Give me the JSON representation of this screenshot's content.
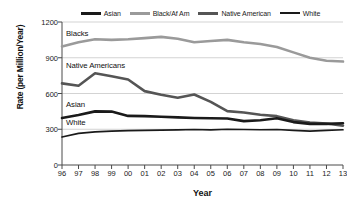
{
  "chart_data": {
    "type": "line",
    "title": "",
    "xlabel": "Year",
    "ylabel": "Rate (per Million/Year)",
    "x": [
      "96",
      "97",
      "98",
      "99",
      "00",
      "01",
      "02",
      "03",
      "04",
      "05",
      "06",
      "07",
      "08",
      "09",
      "10",
      "11",
      "12",
      "13"
    ],
    "xlim": [
      0,
      17
    ],
    "ylim": [
      0,
      1200
    ],
    "yticks": [
      0,
      300,
      600,
      900,
      1200
    ],
    "ytick_labels": [
      "0",
      "300",
      "600",
      "900",
      "1200"
    ],
    "grid": "horizontal",
    "legend_position": "top",
    "series": [
      {
        "name": "Asian",
        "color": "#1a1a1a",
        "width": 2.6,
        "values": [
          395,
          420,
          450,
          448,
          412,
          410,
          405,
          400,
          395,
          392,
          390,
          368,
          376,
          392,
          360,
          345,
          345,
          350
        ]
      },
      {
        "name": "Black/Af Am",
        "color": "#9a9a9a",
        "width": 2.6,
        "values": [
          995,
          1030,
          1055,
          1050,
          1055,
          1065,
          1075,
          1060,
          1030,
          1040,
          1050,
          1030,
          1015,
          990,
          945,
          900,
          875,
          868
        ]
      },
      {
        "name": "Native American",
        "color": "#555555",
        "width": 2.6,
        "values": [
          685,
          665,
          770,
          745,
          718,
          620,
          590,
          565,
          592,
          530,
          452,
          440,
          422,
          410,
          376,
          356,
          348,
          330
        ]
      },
      {
        "name": "White",
        "color": "#1a1a1a",
        "width": 1.7,
        "values": [
          235,
          265,
          278,
          285,
          288,
          290,
          292,
          295,
          298,
          295,
          300,
          298,
          296,
          298,
          290,
          285,
          290,
          296
        ]
      }
    ],
    "annotations": [
      {
        "text": "Blacks",
        "x_index": 0,
        "y_value": 1100
      },
      {
        "text": "Native Americans",
        "x_index": 0,
        "y_value": 830
      },
      {
        "text": "Asian",
        "x_index": 0,
        "y_value": 505
      },
      {
        "text": "White",
        "x_index": 0,
        "y_value": 350
      }
    ]
  },
  "legend": {
    "items": [
      {
        "label": "Asian",
        "color": "#1a1a1a",
        "thickness": "3px"
      },
      {
        "label": "Black/Af Am",
        "color": "#9a9a9a",
        "thickness": "3px"
      },
      {
        "label": "Native American",
        "color": "#555555",
        "thickness": "3px"
      },
      {
        "label": "White",
        "color": "#1a1a1a",
        "thickness": "2px"
      }
    ]
  },
  "axes": {
    "y_title": "Rate (per Million/Year)",
    "x_title": "Year",
    "y_labels": [
      "1200",
      "900",
      "600",
      "300",
      "0"
    ],
    "x_labels": [
      "96",
      "97",
      "98",
      "99",
      "00",
      "01",
      "02",
      "03",
      "04",
      "05",
      "06",
      "07",
      "08",
      "09",
      "10",
      "11",
      "12",
      "13"
    ]
  },
  "annotations": {
    "blacks": "Blacks",
    "native_americans": "Native Americans",
    "asian": "Asian",
    "white": "White"
  },
  "colors": {
    "axis": "#4a4a4a",
    "grid": "#c8c8c8",
    "text": "#1a1a1a",
    "plot_bg": "#ffffff"
  }
}
